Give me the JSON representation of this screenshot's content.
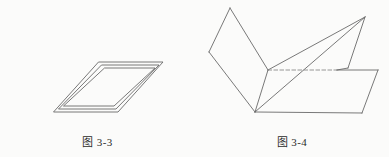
{
  "page": {
    "background_color": "#fbfbfa",
    "ink_color": "#5b5b5b",
    "text_color": "#2b2b2b",
    "width": 389,
    "height": 157
  },
  "figures": [
    {
      "id": "figure-3-3",
      "caption_label": "图",
      "caption_number": "3-3",
      "caption_full": "图 3-3",
      "description": "nested-parallelogram-frame",
      "stroke_color": "#6a6a6a",
      "stroke_width": 0.9,
      "geometry": {
        "type": "nested-parallelograms",
        "rings": [
          {
            "name": "outer-parallelogram",
            "points": "99,62 163,62 118,112 54,112"
          },
          {
            "name": "middle-parallelogram",
            "points": "102,65 159,65 116,109 59,109"
          },
          {
            "name": "inner-parallelogram",
            "points": "105,68 155,68 114,106 64,106"
          }
        ]
      }
    },
    {
      "id": "figure-3-4",
      "caption_label": "图",
      "caption_number": "3-4",
      "caption_full": "图 3-4",
      "description": "folded-planes-dihedral-angle",
      "stroke_color": "#6a6a6a",
      "stroke_width": 0.9,
      "dashed_edge_color": "#8a8a8a",
      "geometry": {
        "type": "folded-planes",
        "vertices": {
          "top_peak": [
            230,
            8
          ],
          "left_vertex": [
            209,
            52
          ],
          "fold_top": [
            268,
            70
          ],
          "bottom_vertex": [
            255,
            112
          ],
          "upper_right_peak": [
            365,
            17
          ],
          "upper_right_low": [
            348,
            68
          ],
          "base_right_top": [
            378,
            70
          ],
          "base_right_bottom": [
            362,
            113
          ]
        },
        "faces": [
          {
            "name": "upper-left-plane",
            "points": "230,8 268,70 255,112 209,52",
            "style": "solid"
          },
          {
            "name": "upper-right-plane",
            "points": "268,70 365,17 348,68",
            "style": "solid"
          },
          {
            "name": "upper-right-diagonal-plane",
            "points": "255,112 365,17 348,68",
            "style": "solid"
          },
          {
            "name": "base-plane",
            "points": "255,112 337,70 378,70 362,113",
            "style": "solid"
          }
        ],
        "edges": [
          {
            "name": "fold-line-hidden",
            "from": [
              268,
              70
            ],
            "to": [
              337,
              70
            ],
            "style": "dashed"
          },
          {
            "name": "base-top-edge",
            "from": [
              337,
              70
            ],
            "to": [
              378,
              70
            ],
            "style": "solid"
          },
          {
            "name": "base-bottom-edge",
            "from": [
              255,
              112
            ],
            "to": [
              362,
              113
            ],
            "style": "solid"
          },
          {
            "name": "base-right-edge",
            "from": [
              378,
              70
            ],
            "to": [
              362,
              113
            ],
            "style": "solid"
          },
          {
            "name": "long-diagonal",
            "from": [
              255,
              112
            ],
            "to": [
              365,
              17
            ],
            "style": "solid"
          },
          {
            "name": "fold-vertical",
            "from": [
              268,
              70
            ],
            "to": [
              255,
              112
            ],
            "style": "solid"
          },
          {
            "name": "upper-right-edge-down",
            "from": [
              365,
              17
            ],
            "to": [
              348,
              68
            ],
            "style": "solid"
          },
          {
            "name": "upper-right-edge-in",
            "from": [
              348,
              68
            ],
            "to": [
              337,
              70
            ],
            "style": "solid"
          },
          {
            "name": "upper-left-top-right",
            "from": [
              230,
              8
            ],
            "to": [
              268,
              70
            ],
            "style": "solid"
          },
          {
            "name": "upper-left-top-left",
            "from": [
              230,
              8
            ],
            "to": [
              209,
              52
            ],
            "style": "solid"
          },
          {
            "name": "upper-left-bottom-left",
            "from": [
              209,
              52
            ],
            "to": [
              255,
              112
            ],
            "style": "solid"
          },
          {
            "name": "upper-right-ridge",
            "from": [
              268,
              70
            ],
            "to": [
              365,
              17
            ],
            "style": "solid"
          }
        ]
      }
    }
  ]
}
